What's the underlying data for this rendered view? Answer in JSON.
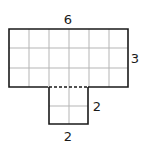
{
  "figure": {
    "type": "composite-rectangle-grid",
    "top_rect": {
      "cols": 6,
      "rows": 3
    },
    "bottom_rect": {
      "cols": 2,
      "rows": 2
    },
    "labels": {
      "top_width": "6",
      "top_height": "3",
      "bottom_height": "2",
      "bottom_width": "2"
    },
    "colors": {
      "outline": "#1a1a1a",
      "grid": "#b5b5b5"
    }
  }
}
